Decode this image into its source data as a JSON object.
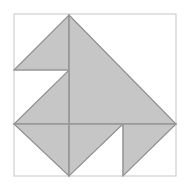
{
  "figure": {
    "canvas": {
      "width": 190,
      "height": 189
    },
    "background_color": "#ffffff",
    "frame": {
      "name": "outer-square-frame",
      "x": 14,
      "y": 14,
      "width": 162,
      "height": 162,
      "stroke_color": "#cfcfcf",
      "stroke_width": 1.2,
      "fill": "none"
    },
    "style": {
      "piece_fill_color": "#c6c6c6",
      "piece_stroke_color": "#8e8e8e",
      "piece_stroke_width": 1.1,
      "grid_stroke_color": "#9a9a9a",
      "grid_stroke_width": 1.1
    },
    "geometry_notes": {
      "grid_origin_x": 14,
      "grid_origin_y": 14,
      "cell_size": 40.5,
      "center_x": 69,
      "center_y": 124,
      "apex_x": 69,
      "apex_y": 15
    },
    "pieces": [
      {
        "name": "piece-top-left-triangle",
        "points": "14,70 69,15 69,70",
        "fill": "#c6c6c6",
        "stroke": "#8e8e8e"
      },
      {
        "name": "piece-large-right-triangle",
        "points": "69,15 176,124 69,124",
        "fill": "#c6c6c6",
        "stroke": "#8e8e8e"
      },
      {
        "name": "piece-middle-left-triangle",
        "points": "69,70 69,124 14,124",
        "fill": "#c6c6c6",
        "stroke": "#8e8e8e"
      },
      {
        "name": "piece-bottom-left-triangle",
        "points": "14,124 69,124 69,176",
        "fill": "#c6c6c6",
        "stroke": "#8e8e8e"
      },
      {
        "name": "piece-bottom-center-triangle",
        "points": "69,124 123,124 69,176",
        "fill": "#c6c6c6",
        "stroke": "#8e8e8e"
      },
      {
        "name": "piece-bottom-right-triangle",
        "points": "123,124 176,124 123,176",
        "fill": "#c6c6c6",
        "stroke": "#8e8e8e"
      }
    ],
    "interior_lines": [
      {
        "name": "line-vertical-center-upper",
        "x1": 69,
        "y1": 15,
        "x2": 69,
        "y2": 124,
        "stroke": "#9a9a9a"
      },
      {
        "name": "line-vertical-center-lower",
        "x1": 69,
        "y1": 124,
        "x2": 69,
        "y2": 176,
        "stroke": "#9a9a9a"
      },
      {
        "name": "line-horizontal-middle",
        "x1": 14,
        "y1": 124,
        "x2": 176,
        "y2": 124,
        "stroke": "#9a9a9a"
      },
      {
        "name": "line-horizontal-upper-left",
        "x1": 14,
        "y1": 70,
        "x2": 69,
        "y2": 70,
        "stroke": "#9a9a9a"
      },
      {
        "name": "line-vertical-right-lower",
        "x1": 123,
        "y1": 124,
        "x2": 123,
        "y2": 176,
        "stroke": "#9a9a9a"
      }
    ]
  }
}
